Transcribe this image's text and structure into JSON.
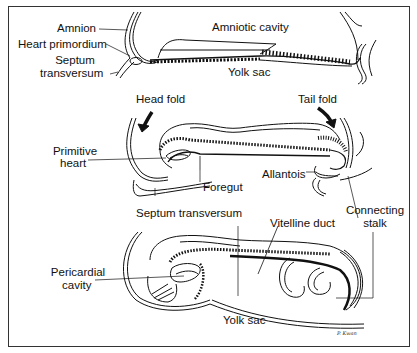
{
  "diagram": {
    "stages": [
      {
        "name": "stage-1",
        "labels": {
          "amnion": "Amnion",
          "heart_primordium": "Heart primordium",
          "septum_1": "Septum",
          "septum_2": "transversum",
          "amniotic_cavity": "Amniotic cavity",
          "yolk_sac": "Yolk sac"
        }
      },
      {
        "name": "stage-2",
        "labels": {
          "head_fold": "Head fold",
          "tail_fold": "Tail fold",
          "primitive_heart_1": "Primitive",
          "primitive_heart_2": "heart",
          "foregut": "Foregut",
          "allantois": "Allantois",
          "connecting_stalk_1": "Connecting",
          "connecting_stalk_2": "stalk",
          "septum_transversum": "Septum transversum"
        }
      },
      {
        "name": "stage-3",
        "labels": {
          "vitelline_duct": "Vitelline duct",
          "pericardial_1": "Pericardial",
          "pericardial_2": "cavity",
          "yolk_sac": "Yolk sac"
        }
      }
    ],
    "signature": "P. Kwan"
  }
}
